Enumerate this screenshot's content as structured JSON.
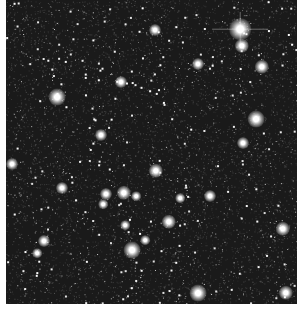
{
  "image": {
    "description": "Dense star field (globular cluster) in grayscale",
    "background_color": "#1a1a1a",
    "margin_color": "#ffffff",
    "frame": {
      "x": 6,
      "y": 0,
      "width": 291,
      "height": 304
    }
  },
  "bright_stars": [
    {
      "x": 240,
      "y": 29,
      "r": 9,
      "spike": true
    },
    {
      "x": 242,
      "y": 46,
      "r": 6
    },
    {
      "x": 262,
      "y": 67,
      "r": 6
    },
    {
      "x": 155,
      "y": 30,
      "r": 5
    },
    {
      "x": 57,
      "y": 97,
      "r": 7
    },
    {
      "x": 121,
      "y": 82,
      "r": 5
    },
    {
      "x": 256,
      "y": 119,
      "r": 7
    },
    {
      "x": 12,
      "y": 164,
      "r": 5
    },
    {
      "x": 101,
      "y": 135,
      "r": 5
    },
    {
      "x": 156,
      "y": 171,
      "r": 6
    },
    {
      "x": 243,
      "y": 143,
      "r": 5
    },
    {
      "x": 62,
      "y": 188,
      "r": 5
    },
    {
      "x": 106,
      "y": 194,
      "r": 5
    },
    {
      "x": 124,
      "y": 193,
      "r": 6
    },
    {
      "x": 136,
      "y": 196,
      "r": 4
    },
    {
      "x": 210,
      "y": 196,
      "r": 5
    },
    {
      "x": 198,
      "y": 64,
      "r": 5
    },
    {
      "x": 169,
      "y": 222,
      "r": 6
    },
    {
      "x": 132,
      "y": 250,
      "r": 7
    },
    {
      "x": 44,
      "y": 241,
      "r": 5
    },
    {
      "x": 145,
      "y": 240,
      "r": 4
    },
    {
      "x": 283,
      "y": 229,
      "r": 6
    },
    {
      "x": 198,
      "y": 293,
      "r": 7
    },
    {
      "x": 286,
      "y": 293,
      "r": 6
    },
    {
      "x": 37,
      "y": 253,
      "r": 4
    },
    {
      "x": 125,
      "y": 225,
      "r": 4
    },
    {
      "x": 180,
      "y": 198,
      "r": 4
    },
    {
      "x": 103,
      "y": 204,
      "r": 4
    }
  ],
  "faint_star_count": 1400,
  "faint_star_seed": 7
}
